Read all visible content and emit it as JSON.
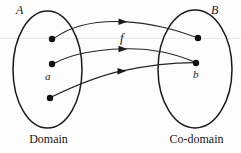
{
  "figure": {
    "colors": {
      "stroke": "#1a1a1a",
      "dot": "#111111",
      "guide_line": "#e8e8e8",
      "background": "#fdfdfd"
    },
    "sets": {
      "domain": {
        "label": "A",
        "caption": "Domain",
        "ellipse": {
          "cx": 47.5,
          "cy": 69.5,
          "rx": 34.5,
          "ry": 58.5
        },
        "elements": [
          {
            "name": "domain-point-top",
            "cx": 52,
            "cy": 39,
            "label": ""
          },
          {
            "name": "domain-point-middle",
            "cx": 52,
            "cy": 64,
            "label": "a"
          },
          {
            "name": "domain-point-bottom",
            "cx": 50,
            "cy": 98,
            "label": ""
          }
        ]
      },
      "codomain": {
        "label": "B",
        "caption": "Co-domain",
        "ellipse": {
          "cx": 195,
          "cy": 69,
          "rx": 37,
          "ry": 59
        },
        "elements": [
          {
            "name": "codomain-point-top",
            "cx": 198,
            "cy": 38,
            "label": ""
          },
          {
            "name": "codomain-point-bottom",
            "cx": 196,
            "cy": 63,
            "label": "b"
          }
        ]
      }
    },
    "function_label": "f",
    "arrows": [
      {
        "name": "arrow-top",
        "from": "domain-point-top",
        "to": "codomain-point-top",
        "arrowhead_at": {
          "x": 124,
          "y": 22
        }
      },
      {
        "name": "arrow-middle",
        "from": "domain-point-middle",
        "to": "codomain-point-bottom",
        "arrowhead_at": {
          "x": 124,
          "y": 49
        }
      },
      {
        "name": "arrow-bottom",
        "from": "domain-point-bottom",
        "to": "codomain-point-bottom",
        "arrowhead_at": {
          "x": 123,
          "y": 71
        }
      }
    ],
    "guide_line": {
      "y": 38.5,
      "x1": 0,
      "x2": 241
    }
  }
}
